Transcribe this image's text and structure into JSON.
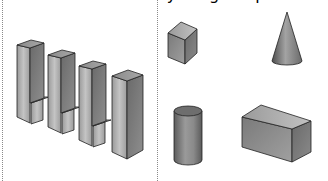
{
  "figure": {
    "left_panel": {
      "label": "stacked block structure",
      "tall_bars": 4,
      "small_cubes": 3
    },
    "right_panel": {
      "shapes": [
        {
          "name": "cube",
          "label": "cube"
        },
        {
          "name": "cone",
          "label": "cone"
        },
        {
          "name": "cylinder",
          "label": "cylinder"
        },
        {
          "name": "rectangular-prism",
          "label": "rectangular prism"
        }
      ]
    },
    "colors": {
      "divider": "#8a8a8a",
      "shape_light": "#c9c9c9",
      "shape_mid": "#8f8f8f",
      "shape_dark": "#5a5a5a",
      "outline": "#222222"
    }
  }
}
